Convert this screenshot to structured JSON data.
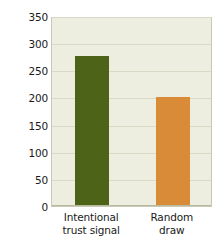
{
  "chart_data": {
    "type": "bar",
    "title": "",
    "xlabel": "",
    "ylabel": "Level of oxytocin (pg/ml)",
    "categories": [
      "Intentional trust signal",
      "Random draw"
    ],
    "category_lines": [
      [
        "Intentional",
        "trust signal"
      ],
      [
        "Random",
        "draw"
      ]
    ],
    "values": [
      277,
      200
    ],
    "ylim": [
      0,
      350
    ],
    "yticks": [
      0,
      50,
      100,
      150,
      200,
      250,
      300,
      350
    ],
    "ytick_labels": [
      "0",
      "50",
      "100",
      "150",
      "200",
      "250",
      "300",
      "350"
    ],
    "grid": true,
    "legend": "none",
    "bar_colors": [
      "#4d6318",
      "#d98b37"
    ],
    "plot_background": "#edeee0",
    "gridline_color": "#d9dac6",
    "frame_color": "#c9c9b4",
    "page_background": "#ffffff",
    "text_color": "#1a1a1a"
  }
}
